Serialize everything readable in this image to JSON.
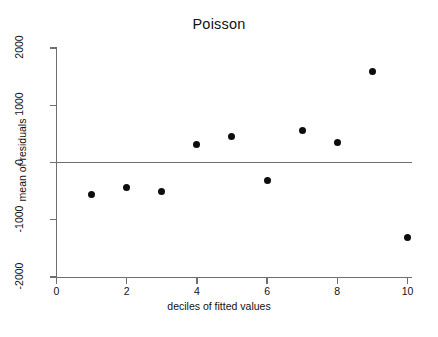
{
  "chart_data": {
    "type": "scatter",
    "title": "Poisson",
    "xlabel": "deciles of fitted values",
    "ylabel": "mean of residuals",
    "x": [
      1,
      2,
      3,
      4,
      5,
      6,
      7,
      8,
      9,
      10
    ],
    "values": [
      -560,
      -440,
      -510,
      315,
      455,
      -315,
      560,
      350,
      1590,
      -1310
    ],
    "series": [
      {
        "name": "mean of residuals",
        "values": [
          -560,
          -440,
          -510,
          315,
          455,
          -315,
          560,
          350,
          1590,
          -1310
        ]
      }
    ],
    "xlim": [
      0,
      10.1
    ],
    "ylim": [
      -2000,
      2000
    ],
    "xticks": [
      0,
      2,
      4,
      6,
      8,
      10
    ],
    "xtick_labels": [
      "0",
      "2",
      "4",
      "6",
      "8",
      "10"
    ],
    "yticks": [
      -2000,
      -1000,
      0,
      1000,
      2000
    ],
    "ytick_labels": [
      "-2000",
      "-1000",
      "0",
      "1000",
      "2000"
    ],
    "grid": false,
    "legend": null,
    "annotations": [
      {
        "kind": "reference-line",
        "axis": "y",
        "value": 0
      }
    ],
    "marker_color": "#0d0d0d",
    "axis_color": "#6f6f6f",
    "background_color": "#ffffff"
  }
}
